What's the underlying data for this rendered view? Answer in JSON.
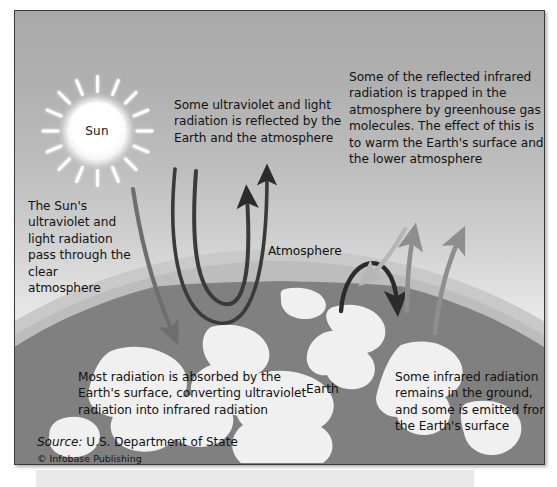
{
  "figure": {
    "sun_label": "Sun",
    "atmosphere_label": "Atmosphere",
    "earth_label": "Earth",
    "callouts": {
      "sun_radiation_passes": "The Sun's ultraviolet and light radiation pass through the clear atmosphere",
      "reflected_by_earth": "Some ultraviolet and light radiation is reflected by the Earth and the atmosphere",
      "greenhouse_trapped": "Some of the reflected infrared radiation is trapped in the atmosphere by greenhouse gas molecules. The effect of this is to warm the Earth's surface and the lower atmosphere",
      "absorbed_by_surface": "Most radiation is absorbed by the Earth's surface, converting ultraviolet radiation into infrared radiation",
      "infrared_remains": "Some infrared radiation remains in the ground, and some is emitted from the Earth's surface"
    },
    "credit": {
      "source_word": "Source:",
      "source_text": " U.S. Department of State",
      "copyright": "© Infobase Publishing"
    },
    "sun_ray_count": 16,
    "colors": {
      "sky_top": "#a9a9a9",
      "sky_bottom": "#f2f2f2",
      "atmosphere_ring": "#bdbdbd",
      "earth_dark": "#808080",
      "earth_light": "#f0f0f0",
      "arrow_dark": "#2b2b2b",
      "arrow_incoming": "#6e6e6e",
      "arrow_grey": "#8e8e8e",
      "arrow_light": "#b6b6b6",
      "frame_border": "#3a3a3a",
      "text": "#121212"
    },
    "arrows": [
      {
        "name": "incoming-solar-arrow",
        "direction": "down-right",
        "tone": "mid-grey",
        "meaning": "Sun's UV and light radiation entering atmosphere"
      },
      {
        "name": "reflected-arrow-inner",
        "direction": "u-turn-up",
        "tone": "dark",
        "meaning": "Radiation reflected by the Earth"
      },
      {
        "name": "reflected-arrow-outer",
        "direction": "u-turn-up",
        "tone": "dark",
        "meaning": "Radiation reflected by the atmosphere"
      },
      {
        "name": "greenhouse-trapped-arrow",
        "direction": "arc-back-down",
        "tone": "dark",
        "meaning": "Infrared trapped by greenhouse gas molecules"
      },
      {
        "name": "downward-infrared-arrow",
        "direction": "down-left",
        "tone": "light-grey",
        "meaning": "Infrared re-radiated back toward the surface"
      },
      {
        "name": "emitted-infrared-arrow-left",
        "direction": "up",
        "tone": "grey",
        "meaning": "Infrared emitted from the Earth's surface"
      },
      {
        "name": "emitted-infrared-arrow-right",
        "direction": "up",
        "tone": "grey",
        "meaning": "Infrared emitted from the Earth's surface"
      }
    ]
  }
}
